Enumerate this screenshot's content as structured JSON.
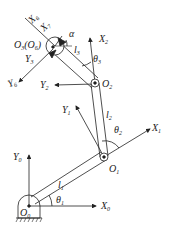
{
  "diagram": {
    "type": "robot-arm-kinematics",
    "stroke_color": "#222222",
    "background": "#ffffff",
    "joints": [
      {
        "id": "O0",
        "label": "O",
        "sub": "0"
      },
      {
        "id": "O1",
        "label": "O",
        "sub": "1"
      },
      {
        "id": "O2",
        "label": "O",
        "sub": "2"
      },
      {
        "id": "O3",
        "label": "O",
        "sub": "3",
        "alias": "(O6)"
      }
    ],
    "links": [
      {
        "label": "l",
        "sub": "1"
      },
      {
        "label": "l",
        "sub": "2"
      },
      {
        "label": "l",
        "sub": "3"
      }
    ],
    "angles": [
      {
        "label": "θ",
        "sub": "1"
      },
      {
        "label": "θ",
        "sub": "2"
      },
      {
        "label": "θ",
        "sub": "3"
      },
      {
        "label": "α",
        "sub": ""
      }
    ],
    "axes": {
      "X0": {
        "label": "X",
        "sub": "0"
      },
      "Y0": {
        "label": "Y",
        "sub": "0"
      },
      "X1": {
        "label": "X",
        "sub": "1"
      },
      "Y1": {
        "label": "Y",
        "sub": "1"
      },
      "X2": {
        "label": "X",
        "sub": "2"
      },
      "Y2": {
        "label": "Y",
        "sub": "2"
      },
      "Y3": {
        "label": "Y",
        "sub": "3"
      },
      "X6": {
        "label": "X",
        "sub": "6"
      },
      "Y6": {
        "label": "Y",
        "sub": "6"
      },
      "X7": {
        "label": "X",
        "sub": "7"
      }
    },
    "o3_text": "O",
    "o3_sub": "3",
    "o3_alias_open": "(O",
    "o3_alias_sub": "6",
    "o3_alias_close": ")"
  }
}
